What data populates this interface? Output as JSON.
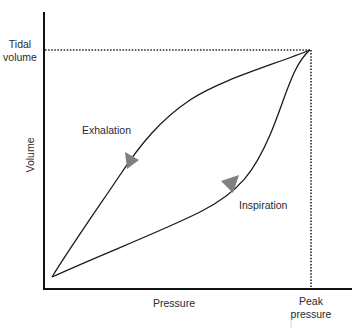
{
  "diagram": {
    "axes": {
      "x_label": "Pressure",
      "y_label": "Volume"
    },
    "markers": {
      "tidal_volume_line1": "Tidal",
      "tidal_volume_line2": "volume",
      "peak_pressure_line1": "Peak",
      "peak_pressure_line2": "pressure"
    },
    "curves": {
      "exhalation_label": "Exhalation",
      "inspiration_label": "Inspiration"
    },
    "colors": {
      "line": "#1a1a1a",
      "arrow": "#808080",
      "text": "#2a2a2a"
    }
  }
}
